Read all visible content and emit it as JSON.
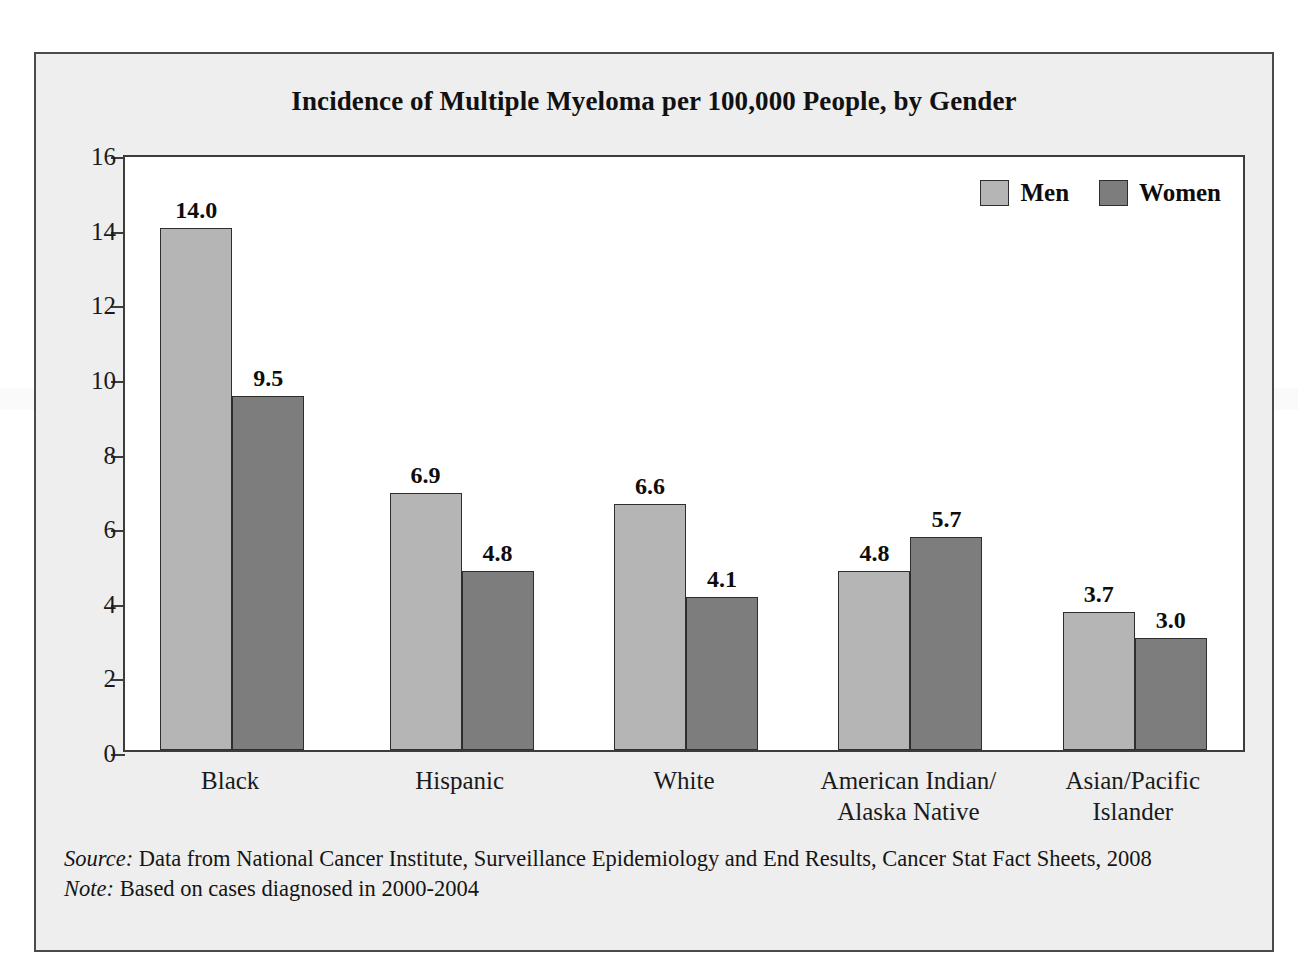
{
  "chart_data": {
    "type": "bar",
    "title": "Incidence of Multiple Myeloma per 100,000 People, by Gender",
    "xlabel": "",
    "ylabel": "",
    "ylim": [
      0,
      16
    ],
    "yticks": [
      0,
      2,
      4,
      6,
      8,
      10,
      12,
      14,
      16
    ],
    "ytick_labels": [
      "0",
      "2",
      "4",
      "6",
      "8",
      "10",
      "12",
      "14",
      "16"
    ],
    "grid": false,
    "legend_position": "top-right",
    "categories": [
      "Black",
      "Hispanic",
      "White",
      "American Indian/\nAlaska Native",
      "Asian/Pacific\nIslander"
    ],
    "series": [
      {
        "name": "Men",
        "color": "#b5b5b5",
        "values": [
          14.0,
          6.9,
          6.6,
          4.8,
          3.7
        ],
        "labels": [
          "14.0",
          "6.9",
          "6.6",
          "4.8",
          "3.7"
        ]
      },
      {
        "name": "Women",
        "color": "#7d7d7d",
        "values": [
          9.5,
          4.8,
          4.1,
          5.7,
          3.0
        ],
        "labels": [
          "9.5",
          "4.8",
          "4.1",
          "5.7",
          "3.0"
        ]
      }
    ]
  },
  "legend": {
    "items": [
      {
        "label": "Men",
        "color": "#b5b5b5"
      },
      {
        "label": "Women",
        "color": "#7d7d7d"
      }
    ]
  },
  "footnotes": {
    "source_lead": "Source:",
    "source_text": "Data from National Cancer Institute, Surveillance Epidemiology and End Results, Cancer Stat Fact Sheets, 2008",
    "note_lead": "Note:",
    "note_text": "Based on cases diagnosed in 2000-2004"
  },
  "colors": {
    "frame_background": "#eeeeee",
    "frame_border": "#4a4a4a",
    "plot_background": "#ffffff",
    "axis": "#3c3c3c",
    "men": "#b5b5b5",
    "women": "#7d7d7d",
    "text": "#111111"
  }
}
